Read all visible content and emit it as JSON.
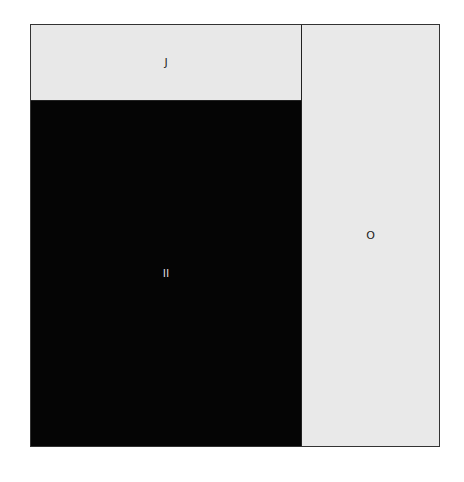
{
  "diagram": {
    "type": "treemap-partition",
    "regions": [
      {
        "id": "J",
        "label": "J",
        "color": "#e8e8e8"
      },
      {
        "id": "II",
        "label": "II",
        "color": "#050505"
      },
      {
        "id": "O",
        "label": "O",
        "color": "#e9e9e9"
      }
    ]
  }
}
